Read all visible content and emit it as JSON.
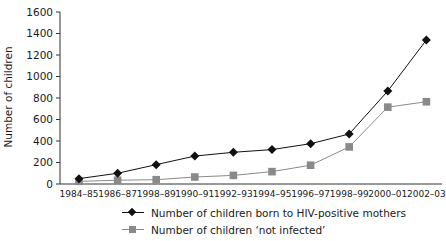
{
  "chart_data": {
    "type": "line",
    "title": "",
    "xlabel": "",
    "ylabel": "Number of children",
    "ylim": [
      0,
      1600
    ],
    "yticks": [
      0,
      200,
      400,
      600,
      800,
      1000,
      1200,
      1400,
      1600
    ],
    "grid": false,
    "legend_position": "bottom",
    "categories": [
      "1984–85",
      "1986–87",
      "1998–89",
      "1990–91",
      "1992–93",
      "1994–95",
      "1996–97",
      "1998–99",
      "2000–01",
      "2002–03"
    ],
    "series": [
      {
        "name": "Number of children born to HIV-positive mothers",
        "marker": "diamond",
        "color": "#111111",
        "values": [
          50,
          100,
          180,
          260,
          295,
          320,
          375,
          465,
          865,
          1340
        ]
      },
      {
        "name": "Number of children ‘not infected’",
        "marker": "square",
        "color": "#8a8a8a",
        "values": [
          25,
          35,
          40,
          65,
          80,
          115,
          175,
          345,
          715,
          765
        ]
      }
    ]
  },
  "legend": {
    "items": [
      {
        "label": "Number of children born to HIV-positive mothers"
      },
      {
        "label": "Number of children ‘not infected’"
      }
    ]
  }
}
